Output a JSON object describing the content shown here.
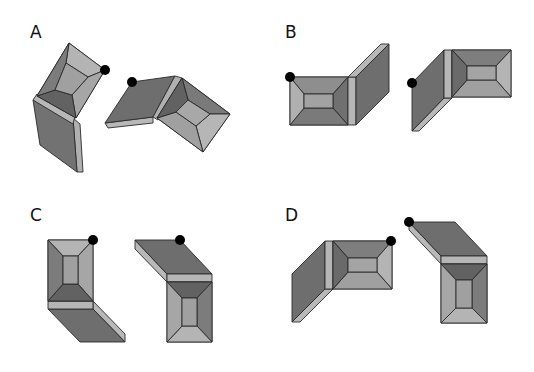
{
  "figure": {
    "type": "mental-rotation-stimuli",
    "panels": [
      {
        "id": "A",
        "label": "A"
      },
      {
        "id": "B",
        "label": "B"
      },
      {
        "id": "C",
        "label": "C"
      },
      {
        "id": "D",
        "label": "D"
      }
    ],
    "colors": {
      "dark": "#6e6e6e",
      "mid": "#8c8c8c",
      "light": "#aeaeae",
      "lighter": "#c4c4c4",
      "marker": "#000000",
      "edge": "#2a2a2a",
      "background": "#ffffff"
    }
  }
}
